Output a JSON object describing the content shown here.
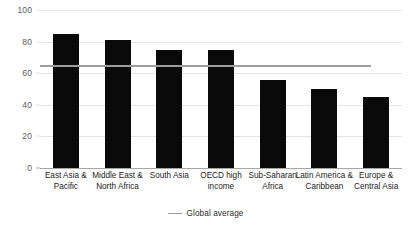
{
  "chart_data": {
    "type": "bar",
    "title": "",
    "subtitle": "",
    "xlabel": "",
    "ylabel": "",
    "ylim": [
      0,
      100
    ],
    "yticks": [
      0,
      20,
      40,
      60,
      80,
      100
    ],
    "ytick_labels": [
      "0",
      "20",
      "40",
      "60",
      "80",
      "100"
    ],
    "grid": true,
    "legend_position": "bottom-center",
    "categories": [
      "East Asia & Pacific",
      "Middle East & North Africa",
      "South Asia",
      "OECD high income",
      "Sub-Saharan Africa",
      "Latin America & Caribbean",
      "Europe & Central Asia"
    ],
    "category_lines": [
      [
        "East Asia &",
        "Pacific"
      ],
      [
        "Middle East &",
        "North Africa"
      ],
      [
        "South Asia"
      ],
      [
        "OECD high",
        "income"
      ],
      [
        "Sub-Saharan",
        "Africa"
      ],
      [
        "Latin America &",
        "Caribbean"
      ],
      [
        "Europe &",
        "Central Asia"
      ]
    ],
    "values": [
      85,
      81,
      75,
      75,
      56,
      50,
      45
    ],
    "series": [
      {
        "name": "Region value",
        "values": [
          85,
          81,
          75,
          75,
          56,
          50,
          45
        ]
      }
    ],
    "reference_lines": [
      {
        "label": "Global average",
        "value": 65,
        "color": "#9d9d9d",
        "extent": "partial"
      }
    ],
    "legend": [
      {
        "label": "Global average",
        "marker": "line",
        "color": "#9d9d9d"
      }
    ]
  },
  "colors": {
    "background": "#ffffff",
    "bar": "#0a0a0a",
    "gridline": "#e3e3e3",
    "axis": "#a6a6a6",
    "average_line": "#9d9d9d",
    "tick_text": "#5a5a5a",
    "category_text": "#1a1a1a"
  },
  "legend_block": {
    "label": "Global average"
  }
}
